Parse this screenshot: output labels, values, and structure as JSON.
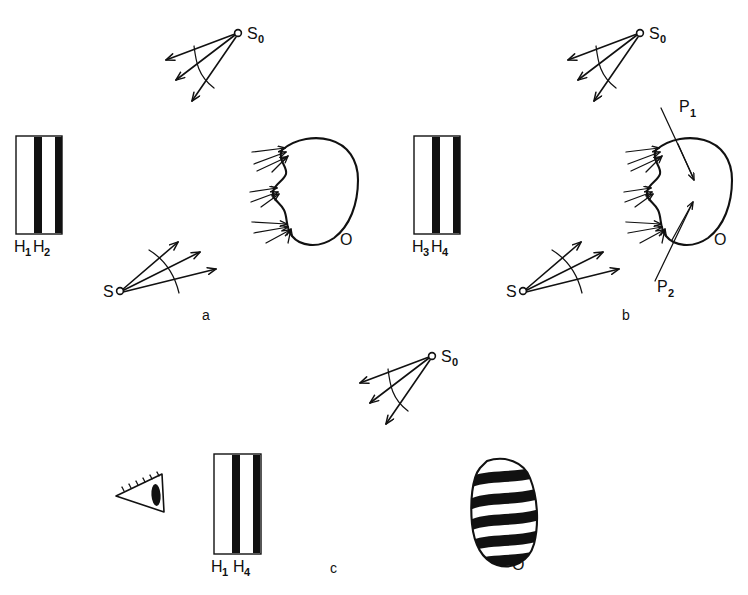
{
  "figure": {
    "kind": "optical-holography-schematic",
    "background_color": "#ffffff",
    "ink_color": "#111111",
    "panel_count": 3
  },
  "panels": [
    {
      "id": "a",
      "letter": "a",
      "letter_pos": {
        "x": 205,
        "y": 318
      },
      "plate": {
        "label_left": "H",
        "label_left_sub": "1",
        "label_right": "H",
        "label_right_sub": "2",
        "label_pos": {
          "x": 14,
          "y": 252
        }
      },
      "sources": [
        {
          "name": "S",
          "label": "S",
          "sub": "0",
          "label_pos": {
            "x": 246,
            "y": 36
          },
          "dot": {
            "x": 238,
            "y": 34
          }
        },
        {
          "name": "S",
          "label": "S",
          "sub": "",
          "label_pos": {
            "x": 105,
            "y": 296
          },
          "dot": {
            "x": 120,
            "y": 291
          }
        }
      ],
      "object": {
        "label": "O",
        "label_pos": {
          "x": 343,
          "y": 243
        },
        "style": "bean-outline",
        "arrow_clusters": 3
      },
      "planes": []
    },
    {
      "id": "b",
      "letter": "b",
      "letter_pos": {
        "x": 625,
        "y": 318
      },
      "plate": {
        "label_left": "H",
        "label_left_sub": "3",
        "label_right": "H",
        "label_right_sub": "4",
        "label_pos": {
          "x": 412,
          "y": 252
        }
      },
      "sources": [
        {
          "name": "S",
          "label": "S",
          "sub": "0",
          "label_pos": {
            "x": 648,
            "y": 36
          },
          "dot": {
            "x": 640,
            "y": 34
          }
        },
        {
          "name": "S",
          "label": "S",
          "sub": "",
          "label_pos": {
            "x": 508,
            "y": 296
          },
          "dot": {
            "x": 523,
            "y": 291
          }
        }
      ],
      "object": {
        "label": "O",
        "label_pos": {
          "x": 717,
          "y": 243
        },
        "style": "bean-outline",
        "arrow_clusters": 3
      },
      "planes": [
        {
          "label": "P",
          "sub": "1",
          "label_pos": {
            "x": 679,
            "y": 110
          }
        },
        {
          "label": "P",
          "sub": "2",
          "label_pos": {
            "x": 659,
            "y": 287
          }
        }
      ]
    },
    {
      "id": "c",
      "letter": "c",
      "letter_pos": {
        "x": 332,
        "y": 571
      },
      "plate": {
        "label_left": "H",
        "label_left_sub": "1",
        "label_right": "H",
        "label_right_sub": "4",
        "label_pos": {
          "x": 208,
          "y": 572
        }
      },
      "sources": [
        {
          "name": "S",
          "label": "S",
          "sub": "0",
          "label_pos": {
            "x": 440,
            "y": 358
          },
          "dot": {
            "x": 432,
            "y": 356
          }
        }
      ],
      "object": {
        "label": "O",
        "label_pos": {
          "x": 516,
          "y": 567
        },
        "style": "striped-oval",
        "stripe_count": 5
      },
      "observer": {
        "icon": "eye-icon",
        "pos": {
          "x": 118,
          "y": 470
        }
      }
    }
  ],
  "labels": {
    "H1": "H",
    "H1_sub": "1",
    "H2": "H",
    "H2_sub": "2",
    "H3": "H",
    "H3_sub": "3",
    "H4": "H",
    "H4_sub": "4",
    "S0": "S",
    "S0_sub": "0",
    "S": "S",
    "P1": "P",
    "P1_sub": "1",
    "P2": "P",
    "P2_sub": "2",
    "O": "O",
    "panel_a": "a",
    "panel_b": "b",
    "panel_c": "c"
  },
  "icons": {
    "source_point": "source-point-icon",
    "wavefront_arc": "wavefront-arc-icon",
    "ray_arrow": "ray-arrow-icon",
    "eye": "eye-icon",
    "hologram_plate": "hologram-plate-icon",
    "object_blob": "object-blob-icon",
    "fringe_object": "fringe-object-icon"
  }
}
